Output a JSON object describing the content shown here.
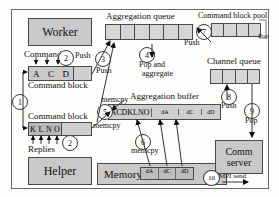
{
  "diagram": {
    "boxes": {
      "worker": "Worker",
      "helper": "Helper",
      "memory": "Memory",
      "comm_server_line1": "Comm",
      "comm_server_line2": "server"
    },
    "queues": {
      "aggregation_queue_label": "Aggregation queue",
      "aggregation_queue_cells": 6,
      "command_block_pool_label": "Command block pool",
      "command_block_pool_cells": 4,
      "channel_queue_label": "Channel queue",
      "channel_queue_cells": 4,
      "aggregation_buffer_label": "Aggregation buffer"
    },
    "command_blocks": {
      "top_label": "Command block",
      "top_cells": [
        "A",
        "C",
        "D"
      ],
      "bottom_label": "Command block",
      "bottom_cells": [
        "K",
        "L",
        "N",
        "O"
      ]
    },
    "aggregation_buffer_cells": [
      "ACDKLNO",
      "dA",
      "dC",
      "dD"
    ],
    "memory_cells": [
      "dA",
      "dC",
      "dD"
    ],
    "edge_labels": {
      "commands": "Commands",
      "replies": "Replies",
      "push_3": "Push",
      "push_3b": "Push",
      "pop_and_aggregate_1": "Pop and",
      "pop_and_aggregate_2": "aggregate",
      "memcpy_5a": "memcpy",
      "memcpy_5b": "memcpy",
      "memcpy_6": "memcpy",
      "push_7": "Push",
      "pop_7": "Pop",
      "push_8": "Push",
      "pop_9": "Pop",
      "mpi_send": "MPI send"
    },
    "step_markers": {
      "s1": "1",
      "s2a": "2",
      "s2b": "2",
      "s3": "3",
      "s4": "4",
      "s5": "5",
      "s6": "6",
      "s7": "7",
      "s8": "8",
      "s9": "9",
      "s10": "10"
    },
    "colors": {
      "box_fill": "#c9c9c9",
      "queue_fill": "#d6d6d6",
      "stroke": "#4a4a4a",
      "background": "#fdfdfb"
    }
  }
}
